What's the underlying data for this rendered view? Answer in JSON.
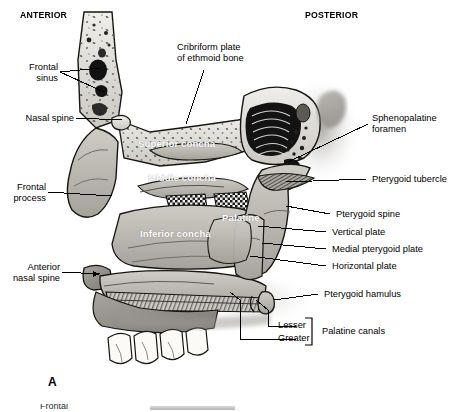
{
  "figure": {
    "panel_label": "A",
    "orientation": {
      "anterior": "ANTERIOR",
      "posterior": "POSTERIOR"
    }
  },
  "labels_left": [
    {
      "id": "frontal-sinus",
      "text": "Frontal\nsinus"
    },
    {
      "id": "nasal-spine",
      "text": "Nasal spine"
    },
    {
      "id": "frontal-process",
      "text": "Frontal\nprocess"
    },
    {
      "id": "anterior-nasal-spine",
      "text": "Anterior\nnasal spine"
    }
  ],
  "labels_top": [
    {
      "id": "cribriform-plate",
      "text": "Cribriform plate\nof ethmoid bone"
    }
  ],
  "labels_right": [
    {
      "id": "sphenopalatine-foramen",
      "text": "Sphenopalatine\nforamen"
    },
    {
      "id": "pterygoid-tubercle",
      "text": "Pterygoid tubercle"
    },
    {
      "id": "pterygoid-spine",
      "text": "Pterygoid spine"
    },
    {
      "id": "vertical-plate",
      "text": "Vertical plate"
    },
    {
      "id": "medial-pterygoid-plate",
      "text": "Medial pterygoid plate"
    },
    {
      "id": "horizontal-plate",
      "text": "Horizontal plate"
    },
    {
      "id": "pterygoid-hamulus",
      "text": "Pterygoid hamulus"
    }
  ],
  "labels_bracket": {
    "items": [
      {
        "id": "lesser",
        "text": "Lesser"
      },
      {
        "id": "greater",
        "text": "Greater"
      }
    ],
    "group_text": "Palatine canals"
  },
  "labels_inside": [
    {
      "id": "superior-concha",
      "text": "Superior concha"
    },
    {
      "id": "middle-concha",
      "text": "Middle concha"
    },
    {
      "id": "inferior-concha",
      "text": "Inferior concha"
    },
    {
      "id": "palatine",
      "text": "Palatine"
    }
  ],
  "colors": {
    "background": "#ffffff",
    "text": "#000000",
    "inside_label": "#ffffff",
    "bone_light": "#e8e6e1",
    "bone_mid": "#b9b6b0",
    "bone_dark": "#8c8984",
    "cavity": "#1a1a1a",
    "leader": "#000000"
  }
}
